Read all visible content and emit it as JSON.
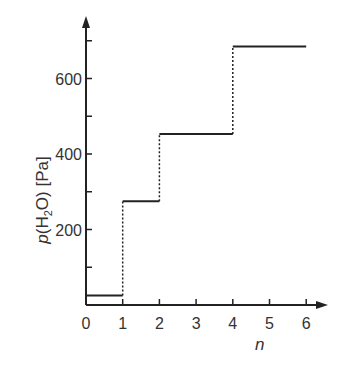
{
  "chart_data": {
    "type": "line",
    "style": "step",
    "title": "",
    "xlabel": "n",
    "ylabel": "p(H2O) [Pa]",
    "ylabel_parts": {
      "italic": "p",
      "open": "(H",
      "sub": "2",
      "close": "O) [Pa]"
    },
    "x_ticks": [
      0,
      1,
      2,
      3,
      4,
      5,
      6
    ],
    "y_ticks_labeled": [
      200,
      400,
      600
    ],
    "y_ticks_minor": [
      100,
      300,
      500,
      700
    ],
    "xlim": [
      0,
      6.5
    ],
    "ylim": [
      0,
      780
    ],
    "grid": false,
    "legend": null,
    "steps": [
      {
        "x_start": 0,
        "x_end": 1,
        "value": 25
      },
      {
        "x_start": 1,
        "x_end": 2,
        "value": 275
      },
      {
        "x_start": 2,
        "x_end": 4,
        "value": 453
      },
      {
        "x_start": 4,
        "x_end": 6,
        "value": 685
      }
    ],
    "transitions": "dotted vertical lines",
    "colors": {
      "line": "#222222",
      "axis": "#222222",
      "text": "#333333"
    }
  }
}
